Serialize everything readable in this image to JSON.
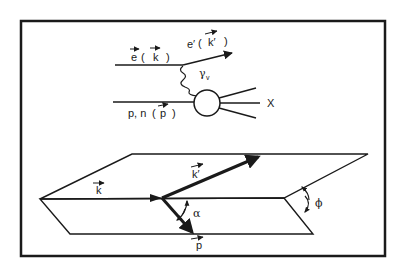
{
  "figure": {
    "frame": {
      "x": 21,
      "y": 21,
      "width": 364,
      "height": 235,
      "stroke": "#1a1a1a"
    },
    "feynman": {
      "incoming_electron": {
        "label_prefix": "e",
        "label_momentum": "k",
        "paren_open": "(",
        "paren_close": ")"
      },
      "outgoing_electron": {
        "label_prefix": "e′",
        "label_momentum": "k′",
        "paren_open": "(",
        "paren_close": ")"
      },
      "virtual_photon": {
        "symbol": "γ",
        "subscript": "v"
      },
      "target_nucleon": {
        "label_prefix": "p, n",
        "label_momentum": "p",
        "paren_open": "(",
        "paren_close": ")"
      },
      "final_state": {
        "label": "X"
      }
    },
    "kinematics": {
      "incoming_momentum": "k",
      "scattered_momentum": "k′",
      "hadron_momentum": "p",
      "polar_angle": "α",
      "azimuthal_angle": "ϕ"
    },
    "colors": {
      "ink": "#1a1a1a",
      "background": "#ffffff"
    }
  }
}
